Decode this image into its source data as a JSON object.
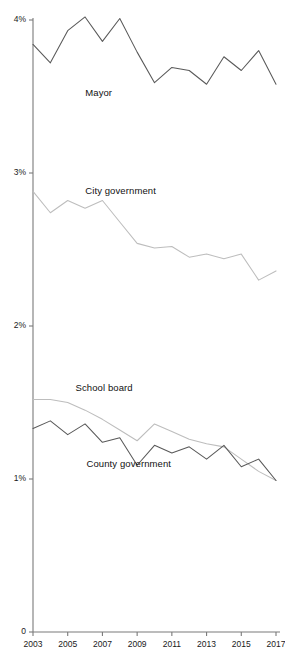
{
  "chart_data": {
    "type": "line",
    "title": "",
    "subtitle": "",
    "xlabel": "",
    "ylabel": "",
    "x": [
      2003,
      2004,
      2005,
      2006,
      2007,
      2008,
      2009,
      2010,
      2011,
      2012,
      2013,
      2014,
      2015,
      2016,
      2017
    ],
    "xtick_labels": [
      "2003",
      "2005",
      "2007",
      "2009",
      "2011",
      "2013",
      "2015",
      "2017"
    ],
    "xtick_values": [
      2003,
      2005,
      2007,
      2009,
      2011,
      2013,
      2015,
      2017
    ],
    "xlim": [
      2003,
      2017
    ],
    "ytick_labels": [
      "0",
      "1%",
      "2%",
      "3%",
      "4%"
    ],
    "ytick_values": [
      0,
      1,
      2,
      3,
      4
    ],
    "ylim": [
      0,
      4.13
    ],
    "yunit": "%",
    "grid": false,
    "legend": "inline-labels",
    "series": [
      {
        "name": "Mayor",
        "color": "#595959",
        "label_x_pct": 0.215,
        "label_y_value": 3.525,
        "values": [
          3.84,
          3.72,
          3.93,
          4.02,
          3.86,
          4.01,
          3.79,
          3.59,
          3.69,
          3.67,
          3.58,
          3.76,
          3.67,
          3.8,
          3.58
        ]
      },
      {
        "name": "City government",
        "color": "#bdbdbd",
        "label_x_pct": 0.215,
        "label_y_value": 2.88,
        "values": [
          2.88,
          2.74,
          2.82,
          2.77,
          2.82,
          2.68,
          2.54,
          2.51,
          2.52,
          2.45,
          2.47,
          2.44,
          2.47,
          2.3,
          2.36
        ]
      },
      {
        "name": "School board",
        "color": "#bdbdbd",
        "label_x_pct": 0.175,
        "label_y_value": 1.595,
        "values": [
          1.52,
          1.52,
          1.5,
          1.45,
          1.39,
          1.32,
          1.25,
          1.36,
          1.31,
          1.26,
          1.23,
          1.21,
          1.13,
          1.05,
          0.99
        ]
      },
      {
        "name": "County government",
        "color": "#595959",
        "label_x_pct": 0.22,
        "label_y_value": 1.1,
        "values": [
          1.33,
          1.38,
          1.29,
          1.36,
          1.24,
          1.27,
          1.09,
          1.22,
          1.17,
          1.21,
          1.13,
          1.22,
          1.08,
          1.13,
          0.99
        ]
      }
    ]
  }
}
